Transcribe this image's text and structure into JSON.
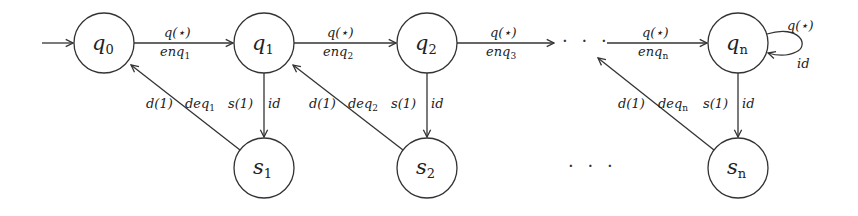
{
  "diagram": {
    "type": "state-machine",
    "colors": {
      "stroke": "#333333",
      "text": "#222222",
      "background": "#ffffff"
    },
    "start_arrow": {
      "target": "q0"
    },
    "states": [
      {
        "id": "q0",
        "base": "q",
        "sub": "0",
        "row": "top"
      },
      {
        "id": "q1",
        "base": "q",
        "sub": "1",
        "row": "top"
      },
      {
        "id": "q2",
        "base": "q",
        "sub": "2",
        "row": "top"
      },
      {
        "id": "qn",
        "base": "q",
        "sub": "n",
        "row": "top"
      },
      {
        "id": "s1",
        "base": "s",
        "sub": "1",
        "row": "bottom"
      },
      {
        "id": "s2",
        "base": "s",
        "sub": "2",
        "row": "bottom"
      },
      {
        "id": "sn",
        "base": "s",
        "sub": "n",
        "row": "bottom"
      }
    ],
    "ellipsis": {
      "top": "· · ·",
      "bottom": "· · ·"
    },
    "transitions": {
      "q0_q1": {
        "top": "q(⋆)",
        "bottom_base": "enq",
        "bottom_sub": "1"
      },
      "q1_q2": {
        "top": "q(⋆)",
        "bottom_base": "enq",
        "bottom_sub": "2"
      },
      "q2_dots": {
        "top": "q(⋆)",
        "bottom_base": "enq",
        "bottom_sub": "3"
      },
      "dots_qn": {
        "top": "q(⋆)",
        "bottom_base": "enq",
        "bottom_sub": "n"
      },
      "qn_loop": {
        "top": "q(⋆)",
        "bottom": "id"
      },
      "q1_s1": {
        "left": "s(1)",
        "right": "id"
      },
      "q2_s2": {
        "left": "s(1)",
        "right": "id"
      },
      "qn_sn": {
        "left": "s(1)",
        "right": "id"
      },
      "s1_q0": {
        "left": "d(1)",
        "right_base": "deq",
        "right_sub": "1"
      },
      "s2_q1": {
        "left": "d(1)",
        "right_base": "deq",
        "right_sub": "2"
      },
      "sn_dots": {
        "left": "d(1)",
        "right_base": "deq",
        "right_sub": "n"
      }
    }
  }
}
